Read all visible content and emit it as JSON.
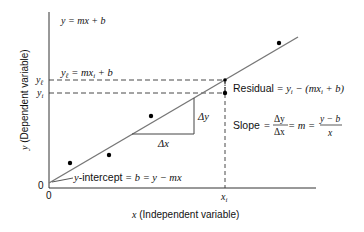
{
  "diagram": {
    "title_equation": "y = mx + b",
    "y_axis_label": "y (Dependent variable)",
    "x_axis_label": "x (Independent variable)",
    "origin_x_label": "0",
    "origin_y_label": "0",
    "y_l_tick": "y",
    "y_l_sub": "ℓ",
    "y_i_tick": "y",
    "y_i_sub": "i",
    "x_i_tick": "x",
    "x_i_sub": "i",
    "fitted_eq": {
      "lhs": "y",
      "lhs_sub": "ℓ",
      "rhs_a": " = mx",
      "rhs_sub": "i",
      "rhs_b": " + b"
    },
    "residual": {
      "label": "Residual",
      "eq_a": " = y",
      "eq_sub1": "i",
      "eq_b": " − (mx",
      "eq_sub2": "i",
      "eq_c": " + b)"
    },
    "slope": {
      "label": "Slope",
      "eq1": " = ",
      "frac1_num": "Δy",
      "frac1_den": "Δx",
      "eq2": " = m = ",
      "frac2_num": "y − b",
      "frac2_den": "x"
    },
    "intercept": {
      "label": "y",
      "text": "-intercept",
      "eq": " = b = y − mx"
    },
    "delta_x": "Δx",
    "delta_y": "Δy",
    "colors": {
      "line": "#777777",
      "axis": "#333333",
      "text": "#111111",
      "point": "#000000"
    }
  }
}
